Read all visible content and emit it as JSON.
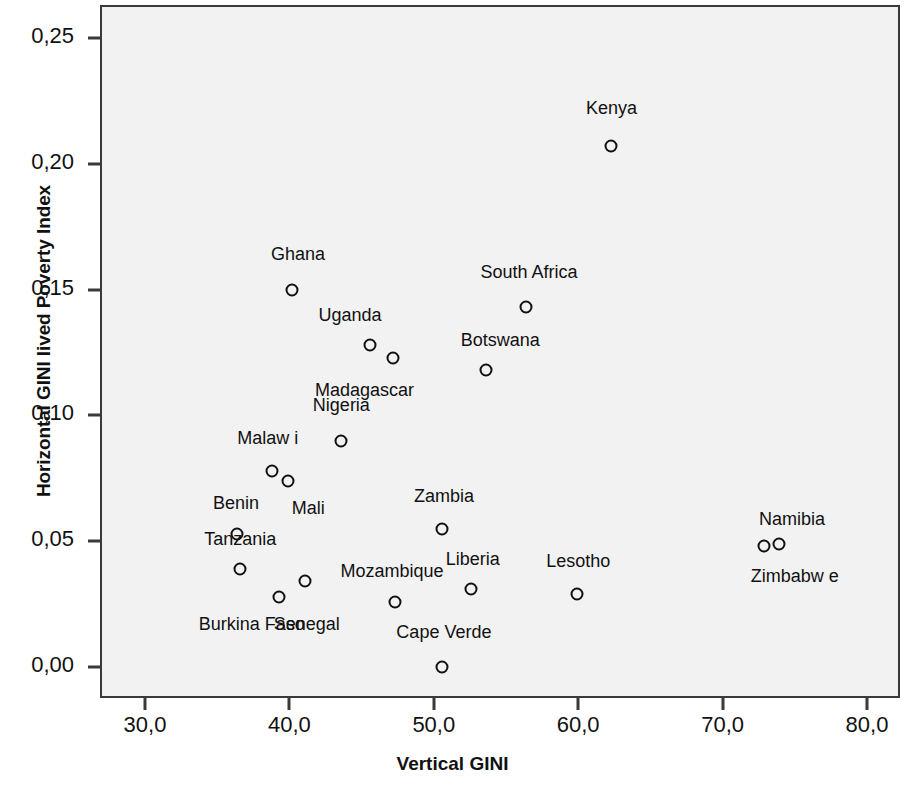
{
  "chart_data": {
    "type": "scatter",
    "title": "",
    "xlabel": "Vertical GINI",
    "ylabel": "Horizontal GINI lived Poverty Index",
    "xlim": [
      27.2,
      82.6
    ],
    "ylim": [
      -0.012,
      0.263
    ],
    "xticks": [
      "30,0",
      "40,0",
      "50,0",
      "60,0",
      "70,0",
      "80,0"
    ],
    "xtick_values": [
      30.0,
      40.0,
      50.0,
      60.0,
      70.0,
      80.0
    ],
    "yticks": [
      "0,00",
      "0,05",
      "0,10",
      "0,15",
      "0,20",
      "0,25"
    ],
    "ytick_values": [
      0.0,
      0.05,
      0.1,
      0.15,
      0.2,
      0.25
    ],
    "grid": false,
    "legend": "none",
    "marker": "open-circle",
    "points": [
      {
        "label": "Kenya",
        "x": 62.3,
        "y": 0.207,
        "lx": 62.3,
        "ly": 0.222
      },
      {
        "label": "South Africa",
        "x": 56.4,
        "y": 0.143,
        "lx": 56.6,
        "ly": 0.157
      },
      {
        "label": "Ghana",
        "x": 40.2,
        "y": 0.15,
        "lx": 40.6,
        "ly": 0.164
      },
      {
        "label": "Uganda",
        "x": 45.6,
        "y": 0.128,
        "lx": 44.2,
        "ly": 0.14
      },
      {
        "label": "Madagascar",
        "x": 47.2,
        "y": 0.123,
        "lx": 45.2,
        "ly": 0.11
      },
      {
        "label": "Botswana",
        "x": 53.6,
        "y": 0.118,
        "lx": 54.6,
        "ly": 0.13
      },
      {
        "label": "Nigeria",
        "x": 43.6,
        "y": 0.09,
        "lx": 43.6,
        "ly": 0.104
      },
      {
        "label": "Malaw i",
        "x": 38.8,
        "y": 0.078,
        "lx": 38.5,
        "ly": 0.091
      },
      {
        "label": "Mali",
        "x": 39.9,
        "y": 0.074,
        "lx": 41.3,
        "ly": 0.063
      },
      {
        "label": "Zambia",
        "x": 50.6,
        "y": 0.055,
        "lx": 50.7,
        "ly": 0.068
      },
      {
        "label": "Benin",
        "x": 36.4,
        "y": 0.053,
        "lx": 36.3,
        "ly": 0.065
      },
      {
        "label": "Namibia",
        "x": 72.9,
        "y": 0.048,
        "lx": 74.8,
        "ly": 0.059
      },
      {
        "label": "Zimbabw e",
        "x": 73.9,
        "y": 0.049,
        "lx": 75.0,
        "ly": 0.036
      },
      {
        "label": "Tanzania",
        "x": 36.6,
        "y": 0.039,
        "lx": 36.6,
        "ly": 0.051
      },
      {
        "label": "Senegal",
        "x": 41.1,
        "y": 0.034,
        "lx": 41.2,
        "ly": 0.017
      },
      {
        "label": "Liberia",
        "x": 52.6,
        "y": 0.031,
        "lx": 52.7,
        "ly": 0.043
      },
      {
        "label": "Lesotho",
        "x": 59.9,
        "y": 0.029,
        "lx": 60.0,
        "ly": 0.042
      },
      {
        "label": "Burkina Faso",
        "x": 39.3,
        "y": 0.028,
        "lx": 37.4,
        "ly": 0.017
      },
      {
        "label": "Mozambique",
        "x": 47.3,
        "y": 0.026,
        "lx": 47.1,
        "ly": 0.038
      },
      {
        "label": "Cape Verde",
        "x": 50.6,
        "y": 0.0,
        "lx": 50.7,
        "ly": 0.014
      }
    ]
  }
}
